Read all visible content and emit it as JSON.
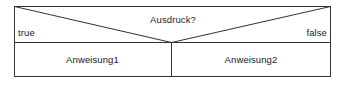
{
  "diagram": {
    "kind": "nassi-shneiderman-if-else-structogram",
    "condition_label": "Ausdruck?",
    "true_branch_label": "true",
    "false_branch_label": "false",
    "true_statement_label": "Anweisung1",
    "false_statement_label": "Anweisung2",
    "colors": {
      "stroke": "#333333",
      "background": "#ffffff",
      "text": "#1a1a1a"
    }
  }
}
